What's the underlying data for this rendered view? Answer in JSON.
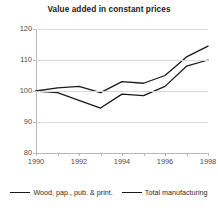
{
  "chart_data": {
    "type": "line",
    "title": "Value added in constant prices",
    "xlabel": "",
    "ylabel": "",
    "x": [
      1990,
      1991,
      1992,
      1993,
      1994,
      1995,
      1996,
      1997,
      1998
    ],
    "xlim": [
      1990,
      1998
    ],
    "ylim": [
      80,
      120
    ],
    "yticks": [
      80,
      90,
      100,
      110,
      120
    ],
    "xticks": [
      1990,
      1992,
      1994,
      1996,
      1998
    ],
    "xtick_labels": [
      "1990",
      "1992",
      "1994",
      "1996",
      "1998"
    ],
    "ytick_labels": [
      "120",
      "110",
      "100",
      "90",
      "80"
    ],
    "grid": true,
    "legend_position": "bottom",
    "series": [
      {
        "name": "Wood, pap., pub. & print.",
        "color": "#1a1a1a",
        "values": [
          100,
          101,
          101.5,
          99.5,
          103,
          102.5,
          105,
          111,
          114.5
        ]
      },
      {
        "name": "Total manufacturing",
        "color": "#1a1a1a",
        "values": [
          100,
          99.5,
          97,
          94.5,
          99,
          98.5,
          101.5,
          108,
          110
        ]
      }
    ]
  },
  "legend": {
    "items": [
      {
        "label": "Wood, pap., pub. & print."
      },
      {
        "label": "Total manufacturing"
      }
    ]
  }
}
